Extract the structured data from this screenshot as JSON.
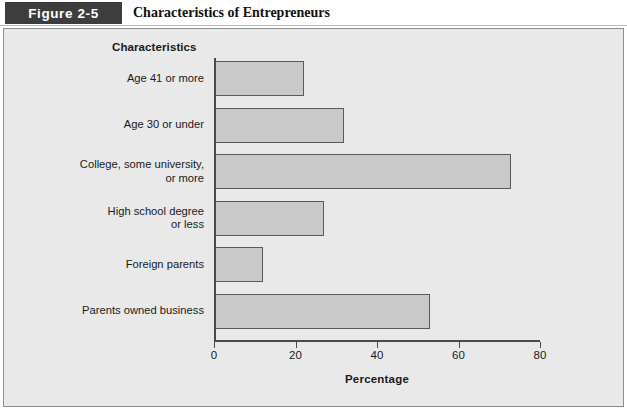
{
  "header": {
    "figure_number": "Figure 2-5",
    "title": "Characteristics of Entrepreneurs"
  },
  "chart_data": {
    "type": "bar",
    "orientation": "horizontal",
    "title": "Characteristics of Entrepreneurs",
    "xlabel": "Percentage",
    "ylabel": "Characteristics",
    "xlim": [
      0,
      80
    ],
    "xticks": [
      "0",
      "20",
      "40",
      "60",
      "80"
    ],
    "grid": false,
    "legend": false,
    "categories": [
      "Age 41 or more",
      "Age 30 or under",
      "College, some university, or more",
      "High school degree or less",
      "Foreign parents",
      "Parents owned business"
    ],
    "category_lines": [
      [
        "Age 41 or more"
      ],
      [
        "Age 30 or under"
      ],
      [
        "College, some university,",
        "or more"
      ],
      [
        "High school degree",
        "or less"
      ],
      [
        "Foreign parents"
      ],
      [
        "Parents owned business"
      ]
    ],
    "values": [
      22,
      32,
      73,
      27,
      12,
      53
    ],
    "bar_fill": "#c9c9c9",
    "bar_border": "#5a5a5a"
  },
  "colors": {
    "panel_background": "#e9e9e9",
    "panel_border": "#8e8e8e",
    "figure_box_background": "#3d3d3d",
    "figure_box_text": "#ffffff",
    "axis": "#4a4a4a",
    "text": "#1a1a1a"
  }
}
